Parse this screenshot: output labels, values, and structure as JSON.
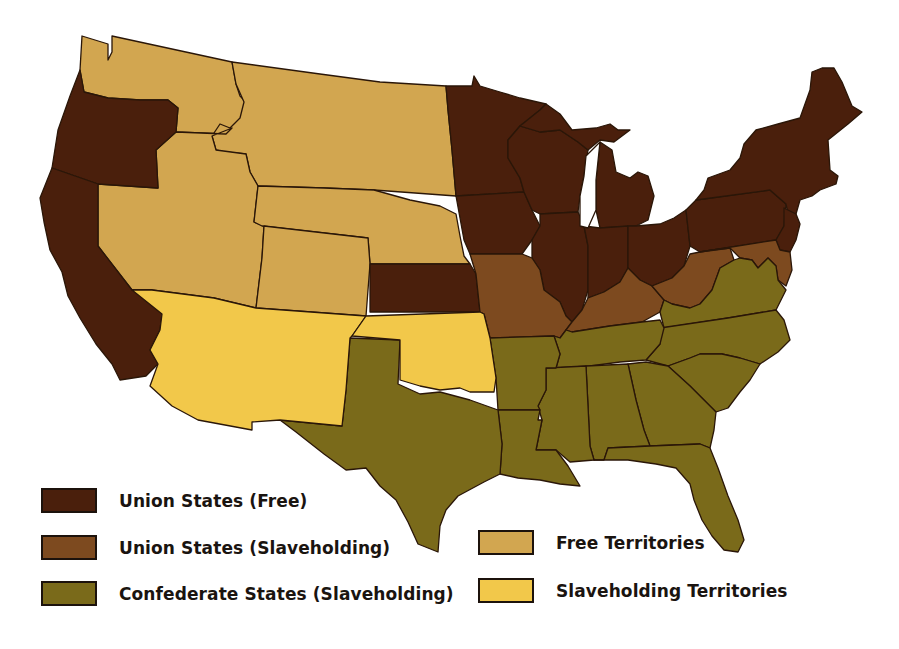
{
  "map": {
    "title": "United States during the Civil War",
    "colors": {
      "union_free": "#4a1f0c",
      "union_slave": "#7d4a1f",
      "confederate": "#7a6a1a",
      "free_territory": "#d2a650",
      "slave_territory": "#f2c84a",
      "background": "#ffffff",
      "border": "#2a1608"
    },
    "regions": {
      "union_free": [
        "Oregon",
        "California",
        "Minnesota",
        "Iowa",
        "Kansas",
        "Wisconsin",
        "Illinois",
        "Michigan",
        "Indiana",
        "Ohio",
        "Pennsylvania",
        "New York",
        "New Jersey",
        "Vermont",
        "New Hampshire",
        "Maine",
        "Massachusetts",
        "Connecticut",
        "Rhode Island"
      ],
      "union_slave": [
        "Missouri",
        "Kentucky",
        "West Virginia",
        "Maryland",
        "Delaware"
      ],
      "confederate": [
        "Texas",
        "Arkansas",
        "Louisiana",
        "Mississippi",
        "Alabama",
        "Tennessee",
        "Georgia",
        "Florida",
        "South Carolina",
        "North Carolina",
        "Virginia"
      ],
      "free_territory": [
        "Washington Territory",
        "Idaho/Montana Territory",
        "Dakota Territory",
        "Nebraska Territory",
        "Nevada",
        "Utah Territory",
        "Colorado Territory"
      ],
      "slave_territory": [
        "New Mexico Territory",
        "Indian Territory"
      ]
    }
  },
  "legend": {
    "items": [
      {
        "key": "union_free",
        "label": "Union States (Free)",
        "color": "#4a1f0c"
      },
      {
        "key": "union_slave",
        "label": "Union States (Slaveholding)",
        "color": "#7d4a1f"
      },
      {
        "key": "confederate",
        "label": "Confederate States (Slaveholding)",
        "color": "#7a6a1a"
      },
      {
        "key": "free_territory",
        "label": "Free Territories",
        "color": "#d2a650"
      },
      {
        "key": "slave_territory",
        "label": "Slaveholding Territories",
        "color": "#f2c84a"
      }
    ]
  }
}
